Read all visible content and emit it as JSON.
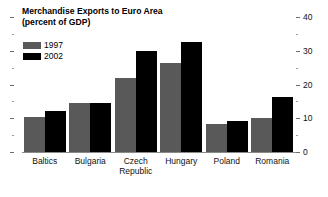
{
  "chart_data": {
    "type": "bar",
    "title": "Merchandise Exports to Euro Area",
    "subtitle": "(percent of GDP)",
    "xlabel": "",
    "ylabel": "",
    "ylim": [
      0,
      40
    ],
    "grid": false,
    "legend_position": "top-left",
    "axis_side": "right",
    "yticks": [
      0,
      10,
      20,
      30,
      40
    ],
    "ytick_labels": [
      "0",
      "10",
      "20",
      "30",
      "40"
    ],
    "minor_yticks": [
      5,
      15,
      25,
      35
    ],
    "categories": [
      "Baltics",
      "Bulgaria",
      "Czech Republic",
      "Hungary",
      "Poland",
      "Romania"
    ],
    "category_lines": [
      [
        "Baltics"
      ],
      [
        "Bulgaria"
      ],
      [
        "Czech",
        "Republic"
      ],
      [
        "Hungary"
      ],
      [
        "Poland"
      ],
      [
        "Romania"
      ]
    ],
    "series": [
      {
        "name": "1997",
        "color": "#595959",
        "values": [
          10.5,
          14.5,
          22.0,
          26.5,
          8.3,
          10.0
        ]
      },
      {
        "name": "2002",
        "color": "#000000",
        "values": [
          12.3,
          14.5,
          30.0,
          32.5,
          9.2,
          16.3
        ]
      }
    ]
  },
  "legend": {
    "items": [
      {
        "label": "1997",
        "color": "#595959"
      },
      {
        "label": "2002",
        "color": "#000000"
      }
    ]
  }
}
